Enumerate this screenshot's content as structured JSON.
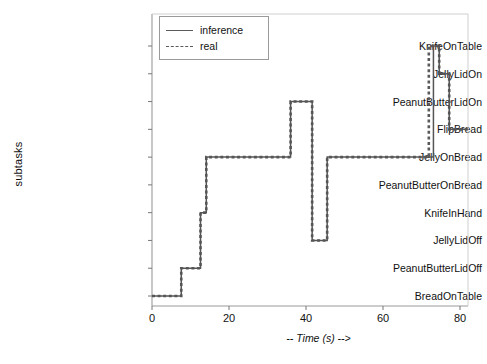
{
  "chart_data": {
    "type": "line",
    "title": "",
    "xlabel": "-- Time (s) -->",
    "ylabel": "subtasks",
    "xlim": [
      0,
      82
    ],
    "ylim": [
      0,
      9
    ],
    "grid": false,
    "legend_position": "top-left",
    "xticks": [
      0,
      20,
      40,
      60,
      80
    ],
    "xtick_labels": [
      "0",
      "20",
      "40",
      "60",
      "80"
    ],
    "ycategories": [
      "BreadOnTable",
      "PeanutButterLidOff",
      "JellyLidOff",
      "KnifeInHand",
      "PeanutButterOnBread",
      "JellyOnBread",
      "FlipBread",
      "PeanutButterLidOn",
      "JellyLidOn",
      "KnifeOnTable"
    ],
    "series": [
      {
        "name": "inference",
        "style": "solid",
        "color": "#555555",
        "steps": [
          {
            "t": 0.0,
            "subtask": "BreadOnTable"
          },
          {
            "t": 7.6,
            "subtask": "PeanutButterLidOff"
          },
          {
            "t": 12.6,
            "subtask": "KnifeInHand"
          },
          {
            "t": 14.1,
            "subtask": "JellyOnBread"
          },
          {
            "t": 36.0,
            "subtask": "PeanutButterLidOn"
          },
          {
            "t": 41.6,
            "subtask": "JellyLidOff"
          },
          {
            "t": 45.5,
            "subtask": "JellyOnBread"
          },
          {
            "t": 73.1,
            "subtask": "KnifeOnTable"
          },
          {
            "t": 74.6,
            "subtask": "JellyLidOn"
          },
          {
            "t": 77.2,
            "subtask": "FlipBread"
          },
          {
            "t": 82.0,
            "subtask": "FlipBread"
          }
        ]
      },
      {
        "name": "real",
        "style": "dashed",
        "color": "#5a5a5a",
        "steps": [
          {
            "t": 0.0,
            "subtask": "BreadOnTable"
          },
          {
            "t": 7.6,
            "subtask": "PeanutButterLidOff"
          },
          {
            "t": 12.6,
            "subtask": "KnifeInHand"
          },
          {
            "t": 14.1,
            "subtask": "JellyOnBread"
          },
          {
            "t": 36.0,
            "subtask": "PeanutButterLidOn"
          },
          {
            "t": 41.6,
            "subtask": "JellyLidOff"
          },
          {
            "t": 45.5,
            "subtask": "JellyOnBread"
          },
          {
            "t": 71.9,
            "subtask": "KnifeOnTable"
          },
          {
            "t": 74.6,
            "subtask": "JellyLidOn"
          },
          {
            "t": 77.2,
            "subtask": "FlipBread"
          },
          {
            "t": 82.0,
            "subtask": "FlipBread"
          }
        ]
      }
    ],
    "legend": [
      {
        "label": "inference",
        "style": "solid"
      },
      {
        "label": "real",
        "style": "dashed"
      }
    ]
  }
}
